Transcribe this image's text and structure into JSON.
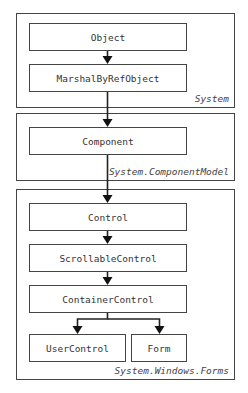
{
  "namespaces": [
    {
      "label": "System"
    },
    {
      "label": "System.ComponentModel"
    },
    {
      "label": "System.Windows.Forms"
    }
  ],
  "classes": {
    "object": "Object",
    "marshal_by_ref_object": "MarshalByRefObject",
    "component": "Component",
    "control": "Control",
    "scrollable_control": "ScrollableControl",
    "container_control": "ContainerControl",
    "user_control": "UserControl",
    "form": "Form"
  },
  "edges": [
    [
      "Object",
      "MarshalByRefObject"
    ],
    [
      "MarshalByRefObject",
      "Component"
    ],
    [
      "Component",
      "Control"
    ],
    [
      "Control",
      "ScrollableControl"
    ],
    [
      "ScrollableControl",
      "ContainerControl"
    ],
    [
      "ContainerControl",
      "UserControl"
    ],
    [
      "ContainerControl",
      "Form"
    ]
  ],
  "colors": {
    "stroke": "#444444",
    "text": "#333333",
    "background": "#ffffff"
  }
}
